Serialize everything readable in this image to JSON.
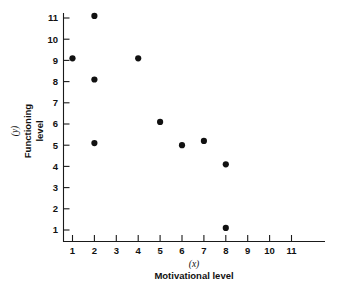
{
  "chart_data": {
    "type": "scatter",
    "title": "",
    "xlabel": "Motivational level",
    "xvar": "(x)",
    "ylabel": "Functioning level",
    "ylabel_line1": "Functioning",
    "ylabel_line2": "level",
    "yvar": "(y)",
    "xlim": [
      0,
      12
    ],
    "ylim": [
      0,
      11.8
    ],
    "xticks": [
      1,
      2,
      3,
      4,
      5,
      6,
      7,
      8,
      9,
      10,
      11
    ],
    "yticks": [
      1,
      2,
      3,
      4,
      5,
      6,
      7,
      8,
      9,
      10,
      11
    ],
    "xtick_labels": [
      "1",
      "2",
      "3",
      "4",
      "5",
      "6",
      "7",
      "8",
      "9",
      "10",
      "11"
    ],
    "ytick_labels": [
      "1",
      "2",
      "3",
      "4",
      "5",
      "6",
      "7",
      "8",
      "9",
      "10",
      "11"
    ],
    "grid": false,
    "legend": null,
    "marker": "filled-circle",
    "marker_color": "#111111",
    "points": [
      {
        "x": 1,
        "y": 9.1
      },
      {
        "x": 2,
        "y": 11.1
      },
      {
        "x": 2,
        "y": 8.1
      },
      {
        "x": 2,
        "y": 5.1
      },
      {
        "x": 4,
        "y": 9.1
      },
      {
        "x": 5,
        "y": 6.1
      },
      {
        "x": 6,
        "y": 5.0
      },
      {
        "x": 7,
        "y": 5.2
      },
      {
        "x": 8,
        "y": 4.1
      },
      {
        "x": 8,
        "y": 1.1
      }
    ]
  }
}
